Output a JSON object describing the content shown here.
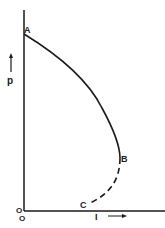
{
  "diagram": {
    "type": "curve-sketch",
    "axes": {
      "y_label": "p",
      "x_label": "I",
      "origin_labels": [
        "O",
        "O"
      ]
    },
    "points": {
      "A": "A",
      "B": "B",
      "C": "C"
    },
    "segments": [
      {
        "from": "A",
        "to": "B",
        "style": "solid"
      },
      {
        "from": "B",
        "to": "C",
        "style": "dashed"
      }
    ],
    "colors": {
      "ink": "#1a1a1a",
      "background": "#ffffff"
    }
  }
}
